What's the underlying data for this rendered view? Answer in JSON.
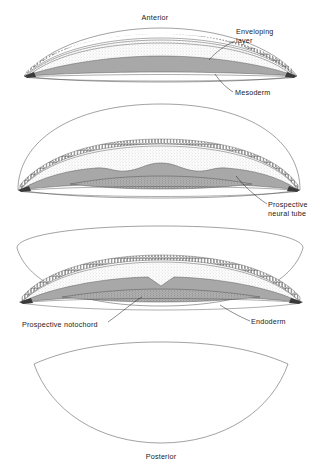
{
  "figure": {
    "panel_count": 4
  },
  "labels": {
    "anterior": "Anterior",
    "enveloping_layer_line1": "Enveloping",
    "enveloping_layer_line2": "layer",
    "mesoderm": "Mesoderm",
    "prospective_neural_tube_line1": "Prospective",
    "prospective_neural_tube_line2": "neural tube",
    "prospective_notochord": "Prospective notochord",
    "endoderm": "Endoderm",
    "posterior": "Posterior"
  },
  "panels": [
    {
      "name": "panel-1-anterior",
      "index": 1,
      "labels": [
        "Anterior",
        "Enveloping layer",
        "Mesoderm"
      ]
    },
    {
      "name": "panel-2",
      "index": 2,
      "labels": [
        "Prospective neural tube"
      ]
    },
    {
      "name": "panel-3",
      "index": 3,
      "labels": [
        "Prospective notochord",
        "Endoderm"
      ]
    },
    {
      "name": "panel-4-posterior",
      "index": 4,
      "labels": [
        "Posterior"
      ]
    }
  ],
  "layers": [
    {
      "key": "enveloping_layer",
      "name": "Enveloping layer",
      "appearance": "row of small rectangular cells",
      "color": "#ffffff"
    },
    {
      "key": "ectoderm",
      "name": "Ectoderm / deep blastoderm",
      "appearance": "fine stipple",
      "color": "#f2f2f2"
    },
    {
      "key": "mesoderm",
      "name": "Mesoderm",
      "appearance": "solid mid gray",
      "color": "#a8a8a8"
    },
    {
      "key": "notochord",
      "name": "Prospective notochord",
      "appearance": "coarse granular band",
      "color": "#9a9a9a"
    },
    {
      "key": "endoderm",
      "name": "Endoderm",
      "appearance": "thin outline sheet",
      "color": "#ffffff"
    }
  ],
  "colors": {
    "outline": "#555555",
    "ink": "#1a1a1a",
    "mesoderm_gray": "#a8a8a8",
    "ectoderm_gray": "#f2f2f2",
    "notochord_gray": "#9a9a9a",
    "background": "#ffffff"
  }
}
